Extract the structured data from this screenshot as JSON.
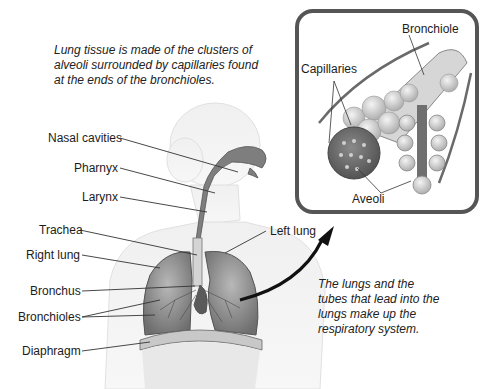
{
  "captions": {
    "top": "Lung tissue is made of the clusters of alveoli surrounded by capillaries found at the ends of the bronchioles.",
    "bottom": "The lungs and the tubes that lead into the lungs make up the respiratory system."
  },
  "body_labels": {
    "nasal_cavities": "Nasal cavities",
    "pharynx": "Pharnyx",
    "larynx": "Larynx",
    "trachea": "Trachea",
    "right_lung": "Right lung",
    "left_lung": "Left lung",
    "bronchus": "Bronchus",
    "bronchioles": "Bronchioles",
    "diaphragm": "Diaphragm"
  },
  "inset_labels": {
    "bronchiole": "Bronchiole",
    "capillaries": "Capillaries",
    "alveoli": "Aveoli"
  },
  "colors": {
    "outline": "#555555",
    "lung_tissue": "#8a8a8a",
    "body_silhouette": "#ececec",
    "arrow": "#111111"
  }
}
